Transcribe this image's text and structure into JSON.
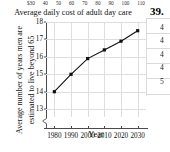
{
  "page": {
    "problem_number": "39.",
    "above_figure": {
      "tick_labels": [
        "$30",
        "40",
        "50",
        "60",
        "70",
        "80",
        "90",
        "100",
        "110"
      ],
      "caption": "Average daily cost of adult day care"
    },
    "right_margin_digits": [
      "4",
      "4",
      "4",
      "4",
      "5"
    ]
  },
  "chart_data": {
    "type": "line",
    "title": "",
    "xlabel": "Year",
    "ylabel_line1": "Average number of years men are",
    "ylabel_line2": "estimated to live beyond 65",
    "x": [
      1980,
      1990,
      2000,
      2010,
      2020,
      2030
    ],
    "values": [
      14.0,
      15.0,
      15.9,
      16.4,
      16.9,
      17.5
    ],
    "xtick_labels": [
      "1980",
      "1990",
      "2000",
      "2010",
      "2020",
      "2030"
    ],
    "ytick_labels": [
      "13",
      "14",
      "15",
      "16",
      "17",
      "18"
    ],
    "yticks": [
      13,
      14,
      15,
      16,
      17,
      18
    ],
    "ylim": [
      12.55,
      18.0
    ],
    "xlim": [
      1975,
      2035
    ],
    "grid": true,
    "legend": "none",
    "axis_break": true,
    "marker": "filled-square",
    "line_color": "#111111",
    "grid_color": "#dedede"
  }
}
